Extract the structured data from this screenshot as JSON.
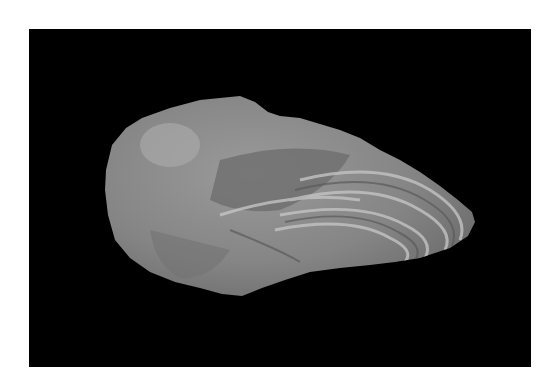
{
  "image": {
    "subject": "Flaked stone artifact (flint tool) photographed on black background",
    "background_color": "#000000",
    "border_color": "#ffffff",
    "stone_colors": {
      "base": "#8a8a8a",
      "light": "#b8b8b8",
      "dark": "#5e5e5e",
      "band": "#c9c9c9"
    }
  }
}
